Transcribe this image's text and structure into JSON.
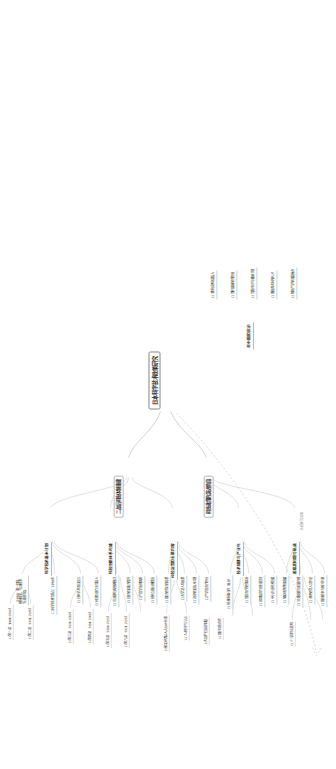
{
  "doc": {
    "type": "mindmap",
    "orientation": "rotated-90-ccw",
    "canvas": {
      "width": 336,
      "height": 769
    },
    "checkbox_glyph": "☐"
  },
  "root": {
    "label": "日本科学技术政策研究"
  },
  "branches": [
    {
      "id": "b1",
      "label": "二战后科技体制重建",
      "children": [
        {
          "label": "（1950）第一阶段：\n模仿欧美，引进技术\n为主的阶段"
        },
        {
          "label": "☐ 科学技术厅成立：1956年"
        },
        {
          "label": "☐ 日本学术会议设立"
        },
        {
          "label": "☐ 经济企划厅主导投入"
        }
      ]
    },
    {
      "id": "b2",
      "label": "科技政策的演进阶段",
      "children": [
        {
          "label": "☐ 引进消化再创新模式"
        },
        {
          "label": "☐ 自主研发能力提升"
        },
        {
          "label": "☐ 产官学协同创新"
        },
        {
          "label": "☐ 技术立国战略提出"
        }
      ]
    },
    {
      "id": "b3",
      "label": "科学技术基本计划",
      "children": [
        {
          "label": "☐ 第一期（1996–2000）"
        },
        {
          "label": "☐ 第二期（2001–2005）"
        },
        {
          "label": "☐ 第三期（2006–2010）"
        },
        {
          "label": "☐ 第四期（2011–2015）"
        },
        {
          "label": "☐ 第五期（2016–2020）"
        },
        {
          "label": "☐ 第六期（2021–2025）"
        }
      ]
    },
    {
      "id": "b4",
      "label": "科技创新体系构建",
      "children": [
        {
          "label": "☐ 国立研究机构改革"
        },
        {
          "label": "☐ 大学法人化改革"
        },
        {
          "label": "☐ 企业研发投入机制"
        },
        {
          "label": "☐ 产学官合作平台"
        }
      ]
    },
    {
      "id": "b5",
      "label": "科技政策的主要内容",
      "children": [
        {
          "label": "☐ 研发经费投入占GDP比重"
        },
        {
          "label": "☐ 人才培养与引进"
        },
        {
          "label": "☐ 知识产权保护制度"
        },
        {
          "label": "☐ 国际科技合作"
        }
      ]
    },
    {
      "id": "b6",
      "label": "技术转移与产业化",
      "children": [
        {
          "label": "☐ 技术转移机构（TLO）"
        },
        {
          "label": "☐ 官官合作研究促进"
        },
        {
          "label": "☐ 风险投资与创业支持"
        },
        {
          "label": "☐ 中小企业技术支援"
        }
      ]
    },
    {
      "id": "b7",
      "label": "面临的问题与挑战",
      "children": [
        {
          "label": "☐ 研发经费增长放缓"
        },
        {
          "label": "☐ 论文数量与质量下降"
        },
        {
          "label": "☐ 年轻研究人员不足"
        },
        {
          "label": "☐ 国际竞争力相对下滑"
        },
        {
          "label": "☐ 少子高龄化影响"
        }
      ]
    },
    {
      "id": "b8",
      "label": "对中国的启示",
      "children": [
        {
          "label": "☐ 坚持长期稳定投入"
        },
        {
          "label": "☐ 强化基础研究布局"
        },
        {
          "label": "☐ 完善评价与激励机制"
        },
        {
          "label": "☐ 重视青年科研人才"
        },
        {
          "label": "☐ 推进产学研深度融合"
        }
      ]
    }
  ],
  "relation": {
    "label": "比较研究关联",
    "style": "dashed-arrow"
  },
  "nodes": [
    {
      "id": "n0",
      "tier": "root",
      "x": 360,
      "y": 157,
      "text": "日本科学技术政策研究"
    },
    {
      "id": "n1",
      "tier": "lvl1",
      "x": 296,
      "y": 120,
      "text": "发展历程与阶段划分"
    },
    {
      "id": "n2",
      "tier": "lvl1",
      "x": 296,
      "y": 200,
      "text": "政策体系与制度安排"
    },
    {
      "id": "n3",
      "tier": "lvl2",
      "x": 232,
      "y": 40,
      "text": "二战后科技体制重建"
    },
    {
      "id": "n4",
      "tier": "lvl2",
      "x": 232,
      "y": 104,
      "text": "科学技术基本计划"
    },
    {
      "id": "n5",
      "tier": "lvl2",
      "x": 232,
      "y": 168,
      "text": "科技创新体系构建"
    },
    {
      "id": "n6",
      "tier": "lvl2",
      "x": 232,
      "y": 232,
      "text": "技术转移与产业化"
    },
    {
      "id": "n7",
      "tier": "lvl2",
      "x": 232,
      "y": 288,
      "text": "面临的问题与挑战"
    },
    {
      "id": "n8",
      "tier": "lvl3",
      "x": 150,
      "y": 18,
      "text": "（1950）第一阶段：模仿欧美，引进技术为主"
    },
    {
      "id": "n9",
      "tier": "lvl3",
      "x": 150,
      "y": 50,
      "text": "☐ 科学技术厅成立 1956年"
    },
    {
      "id": "n10",
      "tier": "lvl3",
      "x": 150,
      "y": 76,
      "text": "☐ 日本学术会议设立"
    }
  ]
}
